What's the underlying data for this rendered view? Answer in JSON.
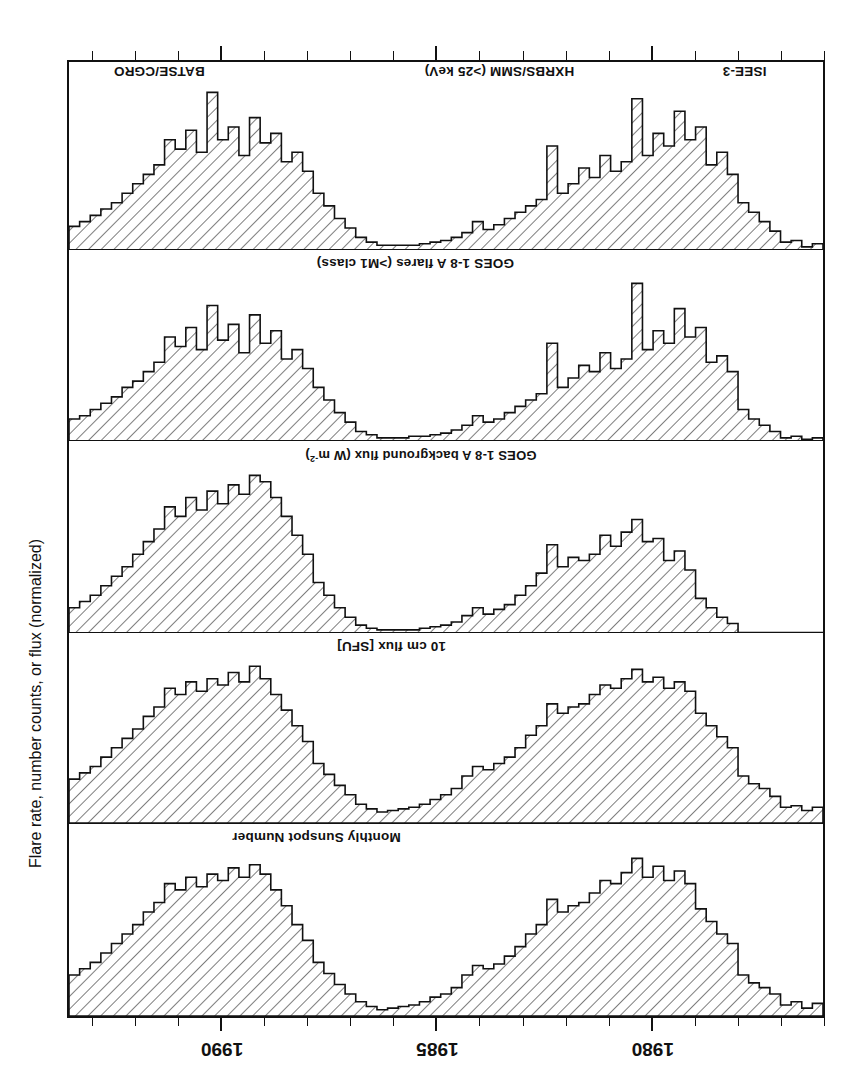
{
  "figure": {
    "orientation": "rotated-180",
    "y_axis_title": "Flare rate, number counts, or flux (normalized)",
    "cut_header_ghost": "",
    "ink_color": "#111111",
    "paper_color": "#ffffff"
  },
  "axis": {
    "x_label": "",
    "x_min": 1976.0,
    "x_max": 1993.6,
    "year_ticks": [
      {
        "year": 1980,
        "label": "1980"
      },
      {
        "year": 1985,
        "label": "1985"
      },
      {
        "year": 1990,
        "label": "1990"
      }
    ],
    "minor_tick_years": [
      1976,
      1977,
      1978,
      1979,
      1980,
      1981,
      1982,
      1983,
      1984,
      1985,
      1986,
      1987,
      1988,
      1989,
      1990,
      1991,
      1992,
      1993
    ]
  },
  "panels": [
    {
      "id": "sunspot",
      "label": "Monthly Sunspot Number",
      "label_x_pct": 56,
      "order": 1
    },
    {
      "id": "radio-flux",
      "label": "10 cm flux [SFU]",
      "label_x_pct": 50,
      "order": 2
    },
    {
      "id": "goes-background",
      "label": "GOES 1-8 A background flux (W m",
      "label_sup": "-2",
      "label_tail": ")",
      "label_x_pct": 38,
      "order": 3
    },
    {
      "id": "goes-flares",
      "label": "GOES 1-8 A flares (>M1 class)",
      "label_x_pct": 41,
      "order": 4
    },
    {
      "id": "hard-xray",
      "label": "",
      "order": 5,
      "instrument_labels": [
        {
          "name": "ISEE-3",
          "x_pct": 7.5
        },
        {
          "name": "HXRBS/SMM (>25 keV)",
          "x_pct": 33
        },
        {
          "name": "BATSE/CGRO",
          "x_pct": 82
        }
      ]
    }
  ],
  "chart_data": {
    "type": "area",
    "title": "",
    "subtitle": "",
    "xlabel": "",
    "ylabel": "Flare rate, number counts, or flux (normalized)",
    "xlim": [
      1976.0,
      1993.6
    ],
    "grid": false,
    "legend": "none",
    "note": "Five stacked hatched step-histograms of monthly solar activity indices, 1976-1993 (solar cycles 21 and 22). Each panel is normalized to its own maximum; values are fractions of panel height.",
    "x": [
      1976.0,
      1976.25,
      1976.5,
      1976.75,
      1977.0,
      1977.25,
      1977.5,
      1977.75,
      1978.0,
      1978.25,
      1978.5,
      1978.75,
      1979.0,
      1979.25,
      1979.5,
      1979.75,
      1980.0,
      1980.25,
      1980.5,
      1980.75,
      1981.0,
      1981.25,
      1981.5,
      1981.75,
      1982.0,
      1982.25,
      1982.5,
      1982.75,
      1983.0,
      1983.25,
      1983.5,
      1983.75,
      1984.0,
      1984.25,
      1984.5,
      1984.75,
      1985.0,
      1985.25,
      1985.5,
      1985.75,
      1986.0,
      1986.25,
      1986.5,
      1986.75,
      1987.0,
      1987.25,
      1987.5,
      1987.75,
      1988.0,
      1988.25,
      1988.5,
      1988.75,
      1989.0,
      1989.25,
      1989.5,
      1989.75,
      1990.0,
      1990.25,
      1990.5,
      1990.75,
      1991.0,
      1991.25,
      1991.5,
      1991.75,
      1992.0,
      1992.25,
      1992.5,
      1992.75,
      1993.0,
      1993.25,
      1993.5
    ],
    "series": [
      {
        "name": "Monthly Sunspot Number",
        "panel": "sunspot",
        "values": [
          0.08,
          0.05,
          0.09,
          0.07,
          0.14,
          0.18,
          0.21,
          0.26,
          0.46,
          0.52,
          0.6,
          0.68,
          0.84,
          0.92,
          0.86,
          0.95,
          0.88,
          1.0,
          0.91,
          0.84,
          0.86,
          0.78,
          0.72,
          0.7,
          0.66,
          0.74,
          0.58,
          0.52,
          0.44,
          0.38,
          0.33,
          0.3,
          0.32,
          0.26,
          0.18,
          0.14,
          0.12,
          0.09,
          0.07,
          0.06,
          0.05,
          0.04,
          0.06,
          0.09,
          0.14,
          0.2,
          0.27,
          0.34,
          0.48,
          0.58,
          0.7,
          0.8,
          0.9,
          0.96,
          0.88,
          0.94,
          0.86,
          0.9,
          0.82,
          0.88,
          0.8,
          0.84,
          0.72,
          0.66,
          0.58,
          0.52,
          0.46,
          0.4,
          0.34,
          0.3,
          0.26
        ]
      },
      {
        "name": "10 cm flux [SFU]",
        "panel": "radio-flux",
        "values": [
          0.1,
          0.08,
          0.11,
          0.1,
          0.17,
          0.22,
          0.25,
          0.3,
          0.48,
          0.55,
          0.62,
          0.7,
          0.84,
          0.9,
          0.86,
          0.93,
          0.9,
          0.98,
          0.92,
          0.86,
          0.88,
          0.82,
          0.76,
          0.74,
          0.7,
          0.76,
          0.62,
          0.56,
          0.48,
          0.42,
          0.38,
          0.34,
          0.36,
          0.3,
          0.22,
          0.18,
          0.15,
          0.12,
          0.1,
          0.09,
          0.08,
          0.07,
          0.09,
          0.12,
          0.18,
          0.24,
          0.31,
          0.38,
          0.52,
          0.62,
          0.72,
          0.82,
          0.92,
          1.0,
          0.9,
          0.96,
          0.88,
          0.92,
          0.84,
          0.9,
          0.82,
          0.86,
          0.74,
          0.68,
          0.6,
          0.54,
          0.48,
          0.42,
          0.36,
          0.32,
          0.28
        ]
      },
      {
        "name": "GOES 1-8 A background flux (W m-2)",
        "panel": "goes-background",
        "values": [
          0.0,
          0.0,
          0.0,
          0.0,
          0.0,
          0.0,
          0.0,
          0.0,
          0.06,
          0.1,
          0.16,
          0.22,
          0.4,
          0.52,
          0.46,
          0.6,
          0.58,
          0.72,
          0.64,
          0.55,
          0.62,
          0.5,
          0.46,
          0.48,
          0.42,
          0.56,
          0.38,
          0.3,
          0.24,
          0.18,
          0.15,
          0.12,
          0.16,
          0.11,
          0.07,
          0.05,
          0.04,
          0.03,
          0.02,
          0.02,
          0.02,
          0.02,
          0.03,
          0.05,
          0.1,
          0.16,
          0.24,
          0.32,
          0.5,
          0.62,
          0.74,
          0.86,
          0.96,
          1.0,
          0.88,
          0.94,
          0.82,
          0.9,
          0.78,
          0.86,
          0.74,
          0.8,
          0.66,
          0.58,
          0.5,
          0.42,
          0.36,
          0.3,
          0.24,
          0.2,
          0.16
        ]
      },
      {
        "name": "GOES 1-8 A flares (>M1 class)",
        "panel": "goes-flares",
        "values": [
          0.02,
          0.01,
          0.03,
          0.02,
          0.06,
          0.1,
          0.14,
          0.2,
          0.44,
          0.54,
          0.5,
          0.72,
          0.66,
          0.84,
          0.62,
          0.7,
          0.58,
          1.0,
          0.52,
          0.46,
          0.56,
          0.44,
          0.48,
          0.4,
          0.34,
          0.62,
          0.3,
          0.26,
          0.22,
          0.18,
          0.14,
          0.12,
          0.16,
          0.1,
          0.07,
          0.05,
          0.04,
          0.03,
          0.03,
          0.02,
          0.02,
          0.02,
          0.04,
          0.06,
          0.12,
          0.18,
          0.26,
          0.34,
          0.46,
          0.58,
          0.52,
          0.7,
          0.62,
          0.8,
          0.56,
          0.74,
          0.64,
          0.86,
          0.58,
          0.72,
          0.6,
          0.66,
          0.5,
          0.44,
          0.38,
          0.34,
          0.28,
          0.24,
          0.2,
          0.16,
          0.14
        ]
      },
      {
        "name": "ISEE-3 / HXRBS-SMM (>25 keV) / BATSE-CGRO",
        "panel": "hard-xray",
        "values": [
          0.04,
          0.02,
          0.06,
          0.05,
          0.12,
          0.18,
          0.24,
          0.3,
          0.48,
          0.62,
          0.54,
          0.78,
          0.7,
          0.88,
          0.66,
          0.74,
          0.6,
          0.96,
          0.56,
          0.5,
          0.6,
          0.46,
          0.52,
          0.42,
          0.36,
          0.66,
          0.32,
          0.28,
          0.24,
          0.2,
          0.16,
          0.13,
          0.18,
          0.11,
          0.08,
          0.06,
          0.05,
          0.04,
          0.03,
          0.03,
          0.03,
          0.03,
          0.05,
          0.08,
          0.14,
          0.2,
          0.28,
          0.36,
          0.5,
          0.62,
          0.56,
          0.74,
          0.68,
          0.84,
          0.6,
          0.78,
          0.7,
          1.0,
          0.62,
          0.76,
          0.64,
          0.7,
          0.54,
          0.48,
          0.42,
          0.36,
          0.3,
          0.26,
          0.22,
          0.18,
          0.15
        ]
      }
    ]
  }
}
